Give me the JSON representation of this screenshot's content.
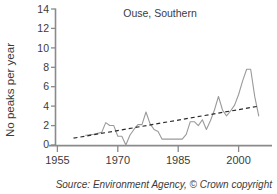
{
  "figure": {
    "source_caption": "Source: Environment Agency, © Crown copyright"
  },
  "chart_data": {
    "type": "line",
    "title": "Ouse, Southern",
    "xlabel": "",
    "ylabel": "No peaks per year",
    "xlim": [
      1955,
      2006
    ],
    "ylim": [
      0,
      14
    ],
    "xticks": [
      1955,
      1970,
      1985,
      2000
    ],
    "xtick_labels": [
      "1955",
      "1970",
      "1985",
      "2000"
    ],
    "yticks": [
      0,
      2,
      4,
      6,
      8,
      10,
      12,
      14
    ],
    "ytick_labels": [
      "0",
      "2",
      "4",
      "6",
      "8",
      "10",
      "12",
      "14"
    ],
    "grid": false,
    "legend": false,
    "legend_position": "none",
    "series": [
      {
        "name": "No peaks per year",
        "style": "solid",
        "color": "#9a9a9a",
        "x": [
          1962,
          1964,
          1966,
          1967,
          1968,
          1969,
          1970,
          1971,
          1972,
          1973,
          1974,
          1975,
          1976,
          1977,
          1978,
          1979,
          1980,
          1981,
          1982,
          1983,
          1984,
          1985,
          1986,
          1987,
          1988,
          1989,
          1990,
          1991,
          1992,
          1993,
          1994,
          1995,
          1996,
          1997,
          1998,
          1999,
          2000,
          2001,
          2002,
          2003,
          2004,
          2005
        ],
        "values": [
          1.0,
          1.1,
          1.3,
          2.3,
          2.0,
          2.0,
          0.9,
          0.9,
          0.0,
          1.0,
          1.6,
          2.1,
          2.1,
          3.4,
          2.2,
          1.6,
          1.4,
          0.6,
          0.6,
          0.6,
          0.6,
          0.6,
          0.6,
          1.1,
          2.4,
          2.4,
          2.0,
          2.6,
          1.6,
          2.5,
          3.6,
          5.0,
          3.6,
          3.0,
          3.5,
          4.1,
          5.2,
          6.6,
          7.8,
          7.8,
          5.0,
          3.0
        ]
      },
      {
        "name": "Linear trend",
        "style": "dashed",
        "color": "#2b2b2b",
        "x": [
          1959,
          2005
        ],
        "values": [
          0.7,
          4.0
        ]
      }
    ]
  }
}
